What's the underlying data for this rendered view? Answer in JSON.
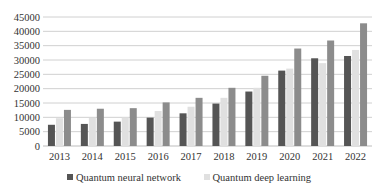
{
  "chart_data": {
    "type": "bar",
    "title": "",
    "xlabel": "",
    "ylabel": "",
    "categories": [
      "2013",
      "2014",
      "2015",
      "2016",
      "2017",
      "2018",
      "2019",
      "2020",
      "2021",
      "2022"
    ],
    "series": [
      {
        "name": "Quantum neural network",
        "color": "#555555",
        "values": [
          7400,
          7700,
          8500,
          9900,
          11400,
          14800,
          19000,
          26300,
          30600,
          31400
        ]
      },
      {
        "name": "Quantum deep learning",
        "color": "#e0e0e0",
        "values": [
          9700,
          9800,
          9900,
          12200,
          13700,
          16800,
          20300,
          27000,
          28900,
          33500
        ]
      },
      {
        "name": "",
        "color": "#8c8c8c",
        "values": [
          12600,
          13000,
          13200,
          15200,
          16800,
          20300,
          24500,
          34000,
          36800,
          42800
        ]
      }
    ],
    "ylim": [
      0,
      45000
    ],
    "yticks": [
      0,
      5000,
      10000,
      15000,
      20000,
      25000,
      30000,
      35000,
      40000,
      45000
    ],
    "ytick_labels": [
      "0",
      "5000",
      "10000",
      "15000",
      "20000",
      "25000",
      "30000",
      "35000",
      "40000",
      "45000"
    ],
    "grid": true,
    "legend_position": "bottom"
  },
  "legend": {
    "items": [
      {
        "label": "Quantum neural network",
        "color": "#555555"
      },
      {
        "label": "Quantum deep learning",
        "color": "#e0e0e0"
      }
    ]
  }
}
